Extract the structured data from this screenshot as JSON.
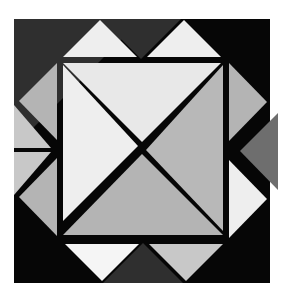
{
  "artwork": {
    "title": "Geometric Tangram Composition",
    "canvas": {
      "width": 283,
      "height": 294,
      "background": "#ffffff"
    },
    "description": "A dark square panel containing an octagonal field of white-gapped triangles; an inner square is split by a diagonal X into four triangles, surrounded by eight edge triangles in graded grays.",
    "gap_color": "#ffffff",
    "palette": {
      "black": "#060606",
      "charcoal": "#2f2f2f",
      "dark_gray": "#6e6e6e",
      "mid_gray": "#a8a8a8",
      "gray": "#b4b4b4",
      "light_gray": "#c8c8c8",
      "pale_gray": "#dcdcdc",
      "near_white": "#eeeeee",
      "white": "#f5f5f5",
      "outline": "#9a9a9a"
    }
  },
  "geometry": {
    "outer_square": {
      "x1": 14,
      "y1": 19,
      "x2": 270,
      "y2": 283
    },
    "inner_square": {
      "x1": 62,
      "y1": 62,
      "x2": 224,
      "y2": 238
    },
    "x_center": {
      "x": 142,
      "y": 148
    }
  },
  "shapes": [
    {
      "id": "panel-background",
      "name": "background-square",
      "kind": "rect",
      "fill": "#060606",
      "points": "14,19 270,19 270,283 14,283"
    },
    {
      "id": "corner-top-left",
      "name": "corner-triangle-top-left",
      "kind": "triangle",
      "fill": "#2f2f2f",
      "points": "14,19 142,19 14,147"
    },
    {
      "id": "corner-top-right",
      "name": "corner-triangle-top-right",
      "kind": "triangle",
      "fill": "#060606",
      "points": "142,19 270,19 270,147"
    },
    {
      "id": "corner-bottom-left",
      "name": "corner-triangle-bottom-left",
      "kind": "triangle",
      "fill": "#060606",
      "points": "14,155 14,283 142,283"
    },
    {
      "id": "corner-bottom-right",
      "name": "corner-triangle-bottom-right",
      "kind": "triangle",
      "fill": "#060606",
      "points": "270,155 270,283 142,283"
    },
    {
      "id": "top-wedge",
      "name": "top-center-dark-wedge",
      "kind": "triangle",
      "fill": "#2f2f2f",
      "points": "101,19 181,19 141,59"
    },
    {
      "id": "bottom-wedge",
      "name": "bottom-center-dark-wedge",
      "kind": "triangle",
      "fill": "#2f2f2f",
      "points": "103,283 183,283 143,243"
    },
    {
      "id": "right-wedge",
      "name": "right-center-dark-wedge",
      "kind": "triangle",
      "fill": "#6e6e6e",
      "points": "278,113 278,190 240,151"
    },
    {
      "id": "top-left-triangle",
      "name": "edge-triangle-top-left",
      "kind": "triangle",
      "fill": "#eeeeee",
      "points": "63,57 137,57 100,20"
    },
    {
      "id": "top-right-triangle",
      "name": "edge-triangle-top-right",
      "kind": "triangle",
      "fill": "#eeeeee",
      "points": "147,57 221,57 184,20"
    },
    {
      "id": "left-upper-triangle",
      "name": "edge-triangle-left-upper",
      "kind": "triangle",
      "fill": "#b4b4b4",
      "points": "57,63 57,140 19,101"
    },
    {
      "id": "left-lower-triangle",
      "name": "edge-triangle-left-lower",
      "kind": "triangle",
      "fill": "#b4b4b4",
      "points": "57,158 57,236 19,197"
    },
    {
      "id": "left-outer-upper",
      "name": "outer-triangle-left-upper",
      "kind": "triangle",
      "fill": "#c8c8c8",
      "points": "14,105 14,148 51,148"
    },
    {
      "id": "left-outer-lower",
      "name": "outer-triangle-left-lower",
      "kind": "triangle",
      "fill": "#c8c8c8",
      "points": "14,152 14,195 51,152"
    },
    {
      "id": "right-upper-triangle",
      "name": "edge-triangle-right-upper",
      "kind": "triangle",
      "fill": "#b4b4b4",
      "points": "229,63 229,141 267,102"
    },
    {
      "id": "right-lower-triangle",
      "name": "edge-triangle-right-lower",
      "kind": "triangle",
      "fill": "#eeeeee",
      "points": "229,160 229,238 267,199"
    },
    {
      "id": "bottom-left-triangle",
      "name": "edge-triangle-bottom-left",
      "kind": "triangle",
      "fill": "#f5f5f5",
      "points": "65,244 139,244 102,281"
    },
    {
      "id": "bottom-right-triangle",
      "name": "edge-triangle-bottom-right",
      "kind": "triangle",
      "fill": "#c8c8c8",
      "points": "149,244 223,244 186,281"
    },
    {
      "id": "inner-top",
      "name": "inner-triangle-top",
      "kind": "triangle",
      "fill": "#e8e8e8",
      "points": "63,63 221,63 142,142"
    },
    {
      "id": "inner-left",
      "name": "inner-triangle-left",
      "kind": "triangle",
      "fill": "#eeeeee",
      "points": "63,65 138,146 63,221"
    },
    {
      "id": "inner-right",
      "name": "inner-triangle-right",
      "kind": "triangle",
      "fill": "#b8b8b8",
      "points": "223,65 223,231 146,150"
    },
    {
      "id": "inner-bottom",
      "name": "inner-triangle-bottom",
      "kind": "triangle",
      "fill": "#b4b4b4",
      "points": "142,154 223,235 63,235"
    }
  ]
}
